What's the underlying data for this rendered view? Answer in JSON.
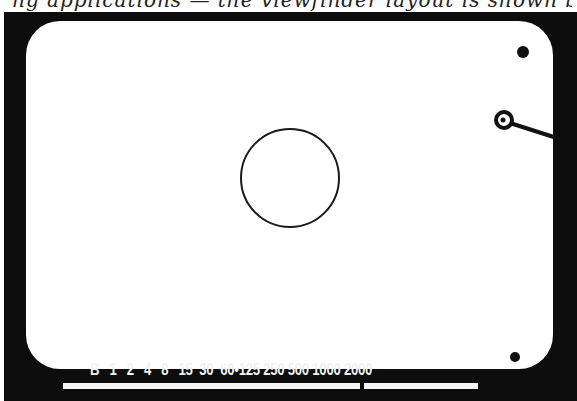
{
  "caption": {
    "text": "ng applications — the viewfinder layout is shown by"
  },
  "viewfinder": {
    "center_circle": {
      "cx": 290,
      "cy": 178,
      "r": 49
    },
    "top_dot": {
      "cx": 523,
      "cy": 52,
      "r": 6
    },
    "needle_ring": {
      "cx": 504,
      "cy": 120,
      "outer_r": 10,
      "inner_r": 4
    },
    "bottom_dot": {
      "cx": 515,
      "cy": 357,
      "r": 5
    }
  },
  "shutter_scale": {
    "labels": [
      "B",
      "1",
      "2",
      "4",
      "8",
      "15",
      "30",
      "60",
      "•",
      "125",
      "250",
      "500",
      "1000",
      "2000"
    ],
    "text": "B   1   2   4   8   15  30  60•125 250 500 1000 2000"
  },
  "colors": {
    "frame": "#0d0d0d",
    "field": "#ffffff",
    "scale_text": "#f2f2f2"
  }
}
